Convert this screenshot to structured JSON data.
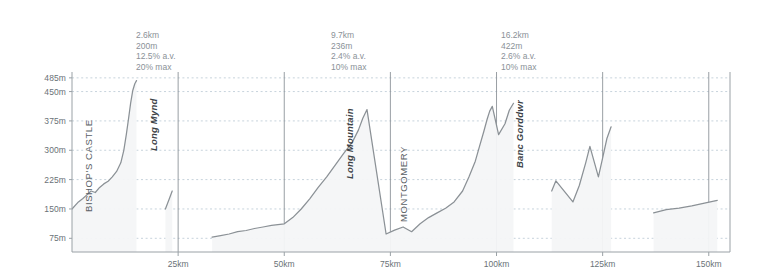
{
  "chart_data": {
    "type": "area",
    "title": "",
    "xlabel": "",
    "ylabel": "",
    "xlim": [
      0,
      155
    ],
    "ylim": [
      40,
      500
    ],
    "grid": true,
    "legend": "none",
    "x_ticks": [
      {
        "value": 25,
        "label": "25km"
      },
      {
        "value": 50,
        "label": "50km"
      },
      {
        "value": 75,
        "label": "75km"
      },
      {
        "value": 100,
        "label": "100km"
      },
      {
        "value": 125,
        "label": "125km"
      },
      {
        "value": 150,
        "label": "150km"
      }
    ],
    "y_ticks": [
      {
        "value": 485,
        "label": "485m"
      },
      {
        "value": 450,
        "label": "450m"
      },
      {
        "value": 375,
        "label": "375m"
      },
      {
        "value": 300,
        "label": "300m"
      },
      {
        "value": 225,
        "label": "225m"
      },
      {
        "value": 150,
        "label": "150m"
      },
      {
        "value": 75,
        "label": "75m"
      }
    ],
    "series": [
      {
        "name": "elevation-profile",
        "units": {
          "x": "km",
          "y": "m"
        },
        "points": [
          [
            0,
            150
          ],
          [
            1.5,
            168
          ],
          [
            2.5,
            176
          ],
          [
            3.5,
            186
          ],
          [
            4.5,
            196
          ],
          [
            5.5,
            192
          ],
          [
            6.5,
            205
          ],
          [
            7.5,
            214
          ],
          [
            8.5,
            221
          ],
          [
            9.5,
            232
          ],
          [
            10.5,
            246
          ],
          [
            11.5,
            268
          ],
          [
            12.2,
            300
          ],
          [
            12.8,
            340
          ],
          [
            13.3,
            380
          ],
          [
            13.8,
            420
          ],
          [
            14.3,
            452
          ],
          [
            14.8,
            470
          ],
          [
            15.2,
            478
          ],
          [
            22.0,
            150
          ],
          [
            23.0,
            178
          ],
          [
            23.6,
            196
          ],
          [
            33.0,
            78
          ],
          [
            35.0,
            82
          ],
          [
            37.0,
            86
          ],
          [
            39.0,
            92
          ],
          [
            41.0,
            95
          ],
          [
            43.0,
            100
          ],
          [
            45.0,
            104
          ],
          [
            47.0,
            108
          ],
          [
            50.0,
            112
          ],
          [
            52.0,
            128
          ],
          [
            54.0,
            150
          ],
          [
            56.0,
            176
          ],
          [
            58.0,
            205
          ],
          [
            60.0,
            232
          ],
          [
            62.0,
            262
          ],
          [
            64.0,
            292
          ],
          [
            66.0,
            320
          ],
          [
            67.5,
            352
          ],
          [
            68.5,
            382
          ],
          [
            69.5,
            404
          ],
          [
            74.0,
            86
          ],
          [
            76.0,
            96
          ],
          [
            78.0,
            104
          ],
          [
            80.0,
            92
          ],
          [
            82.0,
            112
          ],
          [
            84.0,
            128
          ],
          [
            86.0,
            140
          ],
          [
            88.0,
            152
          ],
          [
            90.0,
            168
          ],
          [
            92.0,
            196
          ],
          [
            93.5,
            232
          ],
          [
            95.0,
            272
          ],
          [
            96.0,
            310
          ],
          [
            97.0,
            348
          ],
          [
            97.8,
            380
          ],
          [
            98.4,
            400
          ],
          [
            99.0,
            412
          ],
          [
            100.5,
            340
          ],
          [
            102.0,
            368
          ],
          [
            103.0,
            402
          ],
          [
            104.0,
            420
          ],
          [
            113.0,
            196
          ],
          [
            114.0,
            222
          ],
          [
            118.0,
            168
          ],
          [
            119.5,
            210
          ],
          [
            121.0,
            268
          ],
          [
            122.0,
            310
          ],
          [
            124.0,
            232
          ],
          [
            125.0,
            280
          ],
          [
            126.0,
            330
          ],
          [
            127.0,
            360
          ],
          [
            137.0,
            140
          ],
          [
            140.0,
            148
          ],
          [
            143.0,
            152
          ],
          [
            146.0,
            158
          ],
          [
            149.0,
            165
          ],
          [
            152.0,
            172
          ]
        ]
      }
    ],
    "climb_annotations": [
      {
        "name": "long-mynd",
        "distance": "2.6km",
        "ascent": "200m",
        "average_gradient": "12.5% a.v.",
        "max_gradient": "20% max"
      },
      {
        "name": "long-mountain",
        "distance": "9.7km",
        "ascent": "236m",
        "average_gradient": "2.4% a.v.",
        "max_gradient": "10% max"
      },
      {
        "name": "banc-gorddwr",
        "distance": "16.2km",
        "ascent": "422m",
        "average_gradient": "2.6% a.v.",
        "max_gradient": "10% max"
      }
    ],
    "place_labels": [
      {
        "name": "bishops-castle",
        "text": "BISHOP'S CASTLE",
        "style": "caps"
      },
      {
        "name": "long-mynd",
        "text": "Long Mynd",
        "style": "italic"
      },
      {
        "name": "long-mountain",
        "text": "Long Mountain",
        "style": "italic"
      },
      {
        "name": "montgomery",
        "text": "MONTGOMERY",
        "style": "caps"
      },
      {
        "name": "banc-gorddwr",
        "text": "Banc Gorddwr",
        "style": "italic"
      }
    ],
    "section_dividers_km": [
      25,
      50,
      75,
      100,
      125,
      150
    ],
    "colors": {
      "background": "#ffffff",
      "axis": "#9aa1a6",
      "gridline": "#c7d3dc",
      "divider": "#8d949a",
      "profile_line": "#8b9196",
      "profile_fill": "#f2f4f6",
      "tick_text": "#6a7277",
      "stat_text": "#8a9197",
      "place_text": "#4c5358"
    }
  }
}
